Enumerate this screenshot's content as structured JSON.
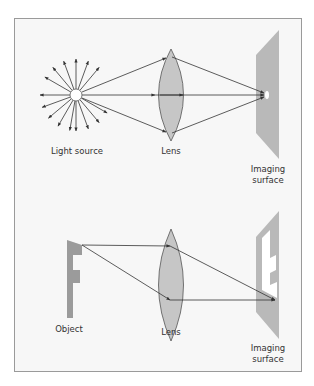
{
  "panels": [
    {
      "id": "light-source-focusing",
      "labels": {
        "source": "Light source",
        "lens": "Lens",
        "surface_line1": "Imaging",
        "surface_line2": "surface"
      }
    },
    {
      "id": "object-inversion",
      "labels": {
        "object": "Object",
        "lens": "Lens",
        "surface_line1": "Imaging",
        "surface_line2": "surface"
      }
    }
  ],
  "colors": {
    "frame_border": "#9a9a9a",
    "frame_fill": "#f7f7f7",
    "lens_fill": "#c6c6c6",
    "surface_fill": "#b9b9b9",
    "object_fill": "#9b9b9b",
    "ray": "#333333"
  }
}
